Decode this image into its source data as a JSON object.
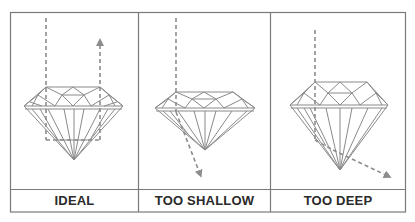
{
  "figure": {
    "border_color": "#7a7a7a",
    "facet_color": "#8a8a8a",
    "ray_color": "#8c8c8c",
    "panels": [
      {
        "label": "IDEAL",
        "ray_behavior": "reflects back up through table"
      },
      {
        "label": "TOO SHALLOW",
        "ray_behavior": "leaks out through bottom-left pavilion"
      },
      {
        "label": "TOO DEEP",
        "ray_behavior": "leaks out through bottom-right pavilion"
      }
    ]
  }
}
